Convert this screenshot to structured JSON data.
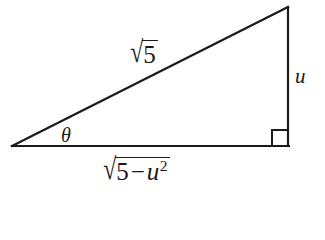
{
  "figure": {
    "background_color": "#ffffff",
    "stroke_color": "#1a1a1a",
    "stroke_width": 2,
    "vertices": {
      "left": [
        12,
        146
      ],
      "bottom_right": [
        288,
        146
      ],
      "top_right": [
        288,
        7
      ]
    },
    "right_angle_marker": {
      "corner": "bottom-right",
      "size": 15
    }
  },
  "labels": {
    "hypotenuse": {
      "surd": "√",
      "radicand": "5",
      "text": "√5"
    },
    "opposite": {
      "text": "u"
    },
    "adjacent": {
      "surd": "√",
      "radicand_base": "5",
      "radicand_operator": "−",
      "radicand_variable": "u",
      "radicand_exponent": "2",
      "text": "√(5 − u²)"
    },
    "angle": {
      "text": "θ"
    }
  }
}
